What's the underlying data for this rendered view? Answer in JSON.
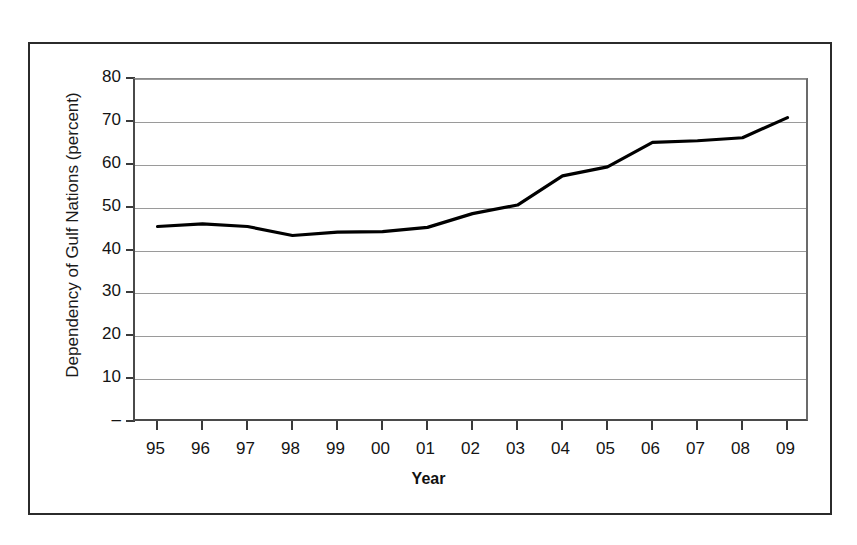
{
  "chart_data": {
    "type": "line",
    "title": "",
    "xlabel": "Year",
    "ylabel": "Dependency of Gulf Nations (percent)",
    "x": [
      "95",
      "96",
      "97",
      "98",
      "99",
      "00",
      "01",
      "02",
      "03",
      "04",
      "05",
      "06",
      "07",
      "08",
      "09"
    ],
    "categories": [
      "95",
      "96",
      "97",
      "98",
      "99",
      "00",
      "01",
      "02",
      "03",
      "04",
      "05",
      "06",
      "07",
      "08",
      "09"
    ],
    "values": [
      45.6,
      46.2,
      45.6,
      43.5,
      44.3,
      44.4,
      45.4,
      48.6,
      50.6,
      57.4,
      59.5,
      65.2,
      65.6,
      66.3,
      71.0
    ],
    "series": [
      {
        "name": "Dependency of Gulf Nations",
        "values": [
          45.6,
          46.2,
          45.6,
          43.5,
          44.3,
          44.4,
          45.4,
          48.6,
          50.6,
          57.4,
          59.5,
          65.2,
          65.6,
          66.3,
          71.0
        ],
        "color": "#000000"
      }
    ],
    "ylim": [
      0,
      80
    ],
    "ytick_values": [
      0,
      10,
      20,
      30,
      40,
      50,
      60,
      70,
      80
    ],
    "ytick_labels": [
      "–",
      "10",
      "20",
      "30",
      "40",
      "50",
      "60",
      "70",
      "80"
    ],
    "xtick_labels": [
      "95",
      "96",
      "97",
      "98",
      "99",
      "00",
      "01",
      "02",
      "03",
      "04",
      "05",
      "06",
      "07",
      "08",
      "09"
    ],
    "grid": true,
    "grid_axis": "y",
    "legend": false,
    "legend_position": "none",
    "line_color": "#000000",
    "grid_color": "#9a9a9a",
    "axis_color": "#3a3a3a",
    "background_color": "#ffffff"
  },
  "axes": {
    "y_title": "Dependency of Gulf Nations (percent)",
    "x_title": "Year"
  }
}
